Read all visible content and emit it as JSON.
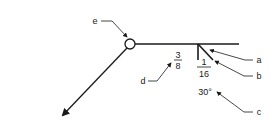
{
  "diagram": {
    "weld_size": {
      "numerator": "3",
      "denominator": "8"
    },
    "root_opening": {
      "numerator": "1",
      "denominator": "16"
    },
    "groove_angle": "30°",
    "callouts": [
      {
        "id": "a",
        "label": "a"
      },
      {
        "id": "b",
        "label": "b"
      },
      {
        "id": "c",
        "label": "c"
      },
      {
        "id": "d",
        "label": "d"
      },
      {
        "id": "e",
        "label": "e"
      }
    ],
    "colors": {
      "line": "#1a1a1a",
      "background": "#ffffff"
    }
  }
}
